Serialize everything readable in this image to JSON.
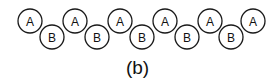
{
  "diagram": {
    "caption": "(b)",
    "stroke_color": "#1a1a1a",
    "circle_radius": 12,
    "nodes": [
      {
        "label": "A",
        "cx": 30,
        "cy": 21
      },
      {
        "label": "B",
        "cx": 52,
        "cy": 37
      },
      {
        "label": "A",
        "cx": 75,
        "cy": 21
      },
      {
        "label": "B",
        "cx": 97,
        "cy": 37
      },
      {
        "label": "A",
        "cx": 120,
        "cy": 21
      },
      {
        "label": "B",
        "cx": 142,
        "cy": 37
      },
      {
        "label": "A",
        "cx": 165,
        "cy": 21
      },
      {
        "label": "B",
        "cx": 187,
        "cy": 37
      },
      {
        "label": "A",
        "cx": 210,
        "cy": 21
      },
      {
        "label": "B",
        "cx": 231,
        "cy": 37
      },
      {
        "label": "A",
        "cx": 253,
        "cy": 21
      }
    ]
  }
}
